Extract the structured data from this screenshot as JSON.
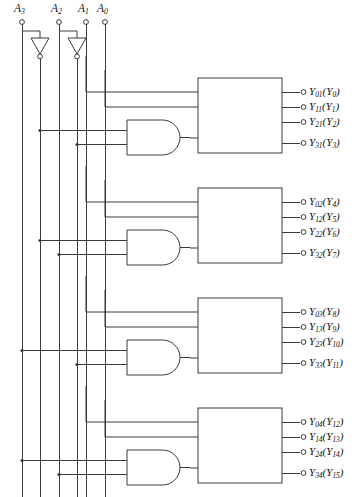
{
  "figure": {
    "kind": "logic-circuit-diagram",
    "line_color": "#3a3a3a",
    "text_color": "#111111",
    "background": "#ffffff"
  },
  "inputs": [
    {
      "name": "A3",
      "label_html": "A<sub>3</sub>",
      "x": 22,
      "inverted_line_x": 40,
      "has_inverter": true
    },
    {
      "name": "A2",
      "label_html": "A<sub>2</sub>",
      "x": 59,
      "inverted_line_x": 77,
      "has_inverter": true
    },
    {
      "name": "A1",
      "label_html": "A<sub>1</sub>",
      "x": 86,
      "inverted_line_x": null,
      "has_inverter": false
    },
    {
      "name": "A0",
      "label_html": "A<sub>0</sub>",
      "x": 105,
      "inverted_line_x": null,
      "has_inverter": false
    }
  ],
  "decoders": [
    {
      "id": "decoder-1",
      "title": "Decoder-1",
      "size": "2 × 4",
      "box": {
        "x": 198,
        "y": 78,
        "w": 84,
        "h": 75
      },
      "enable_from": "and-gate-1",
      "outputs": [
        {
          "label_html": "Y<sub>01</sub>(Y<sub>0</sub>)",
          "y": 92
        },
        {
          "label_html": "Y<sub>11</sub>(Y<sub>1</sub>)",
          "y": 107
        },
        {
          "label_html": "Y<sub>21</sub>(Y<sub>2</sub>)",
          "y": 122
        },
        {
          "label_html": "Y<sub>31</sub>(Y<sub>3</sub>)",
          "y": 143
        }
      ]
    },
    {
      "id": "decoder-2",
      "title": "Decoder-2",
      "size": "2 × 4",
      "box": {
        "x": 198,
        "y": 188,
        "w": 84,
        "h": 75
      },
      "enable_from": "and-gate-2",
      "outputs": [
        {
          "label_html": "Y<sub>02</sub>(Y<sub>4</sub>)",
          "y": 202
        },
        {
          "label_html": "Y<sub>12</sub>(Y<sub>5</sub>)",
          "y": 217
        },
        {
          "label_html": "Y<sub>22</sub>(Y<sub>6</sub>)",
          "y": 232
        },
        {
          "label_html": "Y<sub>32</sub>(Y<sub>7</sub>)",
          "y": 253
        }
      ]
    },
    {
      "id": "decoder-3",
      "title": "Decoder-3",
      "size": "2 × 4",
      "box": {
        "x": 198,
        "y": 298,
        "w": 84,
        "h": 75
      },
      "enable_from": "and-gate-3",
      "outputs": [
        {
          "label_html": "Y<sub>03</sub>(Y<sub>8</sub>)",
          "y": 312
        },
        {
          "label_html": "Y<sub>13</sub>(Y<sub>9</sub>)",
          "y": 327
        },
        {
          "label_html": "Y<sub>23</sub>(Y<sub>10</sub>)",
          "y": 342
        },
        {
          "label_html": "Y<sub>33</sub>(Y<sub>11</sub>)",
          "y": 363
        }
      ]
    },
    {
      "id": "decoder-4",
      "title": "Decoder-4",
      "size": "2 × 4",
      "box": {
        "x": 198,
        "y": 408,
        "w": 84,
        "h": 75
      },
      "enable_from": "and-gate-4",
      "outputs": [
        {
          "label_html": "Y<sub>04</sub>(Y<sub>12</sub>)",
          "y": 422
        },
        {
          "label_html": "Y<sub>14</sub>(Y<sub>13</sub>)",
          "y": 437
        },
        {
          "label_html": "Y<sub>24</sub>(Y<sub>14</sub>)",
          "y": 452
        },
        {
          "label_html": "Y<sub>34</sub>(Y<sub>15</sub>)",
          "y": 473
        }
      ]
    }
  ],
  "and_gates": [
    {
      "id": "and-gate-1",
      "x": 127,
      "y": 120,
      "w": 53,
      "h": 35,
      "inputs": [
        "A3-not",
        "A2-not"
      ],
      "drives": "decoder-1"
    },
    {
      "id": "and-gate-2",
      "x": 127,
      "y": 230,
      "w": 53,
      "h": 35,
      "inputs": [
        "A3-not",
        "A2"
      ],
      "drives": "decoder-2"
    },
    {
      "id": "and-gate-3",
      "x": 127,
      "y": 340,
      "w": 53,
      "h": 35,
      "inputs": [
        "A3",
        "A2-not"
      ],
      "drives": "decoder-3"
    },
    {
      "id": "and-gate-4",
      "x": 127,
      "y": 450,
      "w": 53,
      "h": 35,
      "inputs": [
        "A3",
        "A2"
      ],
      "drives": "decoder-4"
    }
  ],
  "inverters": [
    {
      "id": "inverter-a3",
      "cx": 40,
      "top": 38,
      "bottom": 58
    },
    {
      "id": "inverter-a2",
      "cx": 77,
      "top": 38,
      "bottom": 58
    }
  ]
}
